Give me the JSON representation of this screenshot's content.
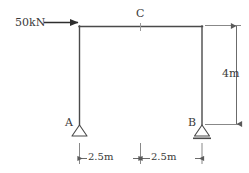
{
  "diagram": {
    "type": "structural-portal-frame",
    "title": "",
    "background_color": "#ffffff",
    "line_color": "#4a4a4a",
    "text_color": "#3a3a3a",
    "labels": {
      "load": "50kN",
      "joint_c": "C",
      "support_a": "A",
      "support_b": "B",
      "height": "4m",
      "span_left": "2.5m",
      "span_right": "2.5m"
    },
    "geometry": {
      "left_column_x": 79,
      "right_column_x": 202,
      "beam_y": 26,
      "base_y": 125,
      "midspan_x": 140.5
    },
    "members": [
      {
        "name": "left-column",
        "from": "A",
        "to": "top-left-corner"
      },
      {
        "name": "top-beam",
        "from": "top-left-corner",
        "to": "top-right-corner"
      },
      {
        "name": "right-column",
        "from": "top-right-corner",
        "to": "B"
      }
    ],
    "supports": [
      {
        "name": "A",
        "kind": "pin",
        "symbol": "triangle"
      },
      {
        "name": "B",
        "kind": "roller-ground",
        "symbol": "triangle-with-ground-line"
      }
    ],
    "loads": [
      {
        "name": "horizontal-point-load",
        "magnitude": "50kN",
        "direction": "right",
        "applied_at": "top-left-corner"
      }
    ],
    "dimensions": [
      {
        "name": "height-dimension",
        "value": "4m",
        "orientation": "vertical",
        "side": "right"
      },
      {
        "name": "span-left-dimension",
        "value": "2.5m",
        "orientation": "horizontal",
        "from": "A",
        "to": "C"
      },
      {
        "name": "span-right-dimension",
        "value": "2.5m",
        "orientation": "horizontal",
        "from": "C",
        "to": "B"
      }
    ]
  }
}
